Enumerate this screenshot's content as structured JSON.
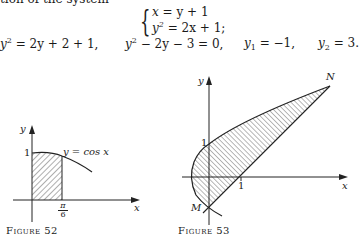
{
  "page": {
    "top_text": "tion of the system",
    "system": {
      "eq1": {
        "lhs": "x",
        "rhs": "= y + 1"
      },
      "eq2": {
        "lhs": "y",
        "sup": "2",
        "rhs": "= 2x + 1;"
      }
    },
    "derivation": [
      {
        "id": "d1",
        "base": "y",
        "sup": "2",
        "rest": " = 2y + 2 + 1,"
      },
      {
        "id": "d2",
        "base": "y",
        "sup": "2",
        "rest": " − 2y − 3 = 0,"
      },
      {
        "id": "d3",
        "base": "y",
        "sub": "1",
        "rest": " = −1,"
      },
      {
        "id": "d4",
        "base": "y",
        "sub": "2",
        "rest": " = 3."
      }
    ],
    "figure52": {
      "caption": "Figure 52",
      "y_axis_label": "y",
      "x_axis_label": "x",
      "y_tick": "1",
      "x_tick_num": "π",
      "x_tick_den": "6",
      "curve_label": "y = cos x"
    },
    "figure53": {
      "caption": "Figure 53",
      "y_axis_label": "y",
      "x_axis_label": "x",
      "y_tick": "1",
      "x_tick": "1",
      "point_n": "N",
      "point_m": "M"
    }
  }
}
